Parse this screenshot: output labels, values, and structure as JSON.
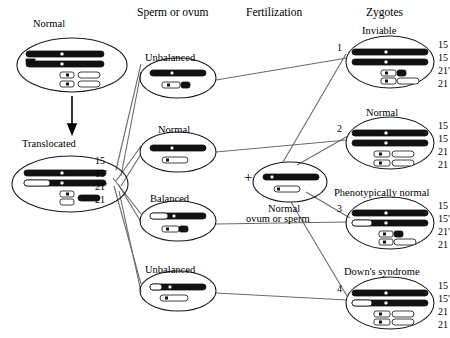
{
  "diagram": {
    "headers": [
      {
        "name": "sperm-or-ovum",
        "text": "Sperm or ovum",
        "x": 137,
        "y": 6
      },
      {
        "name": "fertilization",
        "text": "Fertilization",
        "x": 246,
        "y": 6
      },
      {
        "name": "zygotes",
        "text": "Zygotes",
        "x": 366,
        "y": 6
      }
    ],
    "parents": [
      {
        "name": "normal-parent",
        "caption": "Normal",
        "cx": 72,
        "cy": 65,
        "rx": 55,
        "ry": 27,
        "cap_x": 33,
        "cap_y": 18
      },
      {
        "name": "translocated-parent",
        "caption": "Translocated",
        "cx": 70,
        "cy": 184,
        "rx": 58,
        "ry": 28,
        "cap_x": 22,
        "cap_y": 138
      }
    ],
    "parent_arrow": {
      "name": "meiosis-arrow",
      "x": 72,
      "y1": 95,
      "y2": 131
    },
    "karyotype_labels": {
      "name": "parent-karyotype-labels",
      "x": 95,
      "y": 155,
      "items": [
        "15",
        "15'",
        "21'",
        "21"
      ]
    },
    "gametes": [
      {
        "name": "gamete-unbalanced-1",
        "caption": "Unbalanced",
        "cx": 178,
        "cy": 78,
        "rx": 38,
        "ry": 20,
        "cap_x": 145,
        "cap_y": 52
      },
      {
        "name": "gamete-normal",
        "caption": "Normal",
        "cx": 178,
        "cy": 152,
        "rx": 38,
        "ry": 20,
        "cap_x": 158,
        "cap_y": 124
      },
      {
        "name": "gamete-balanced",
        "caption": "Balanced",
        "cx": 178,
        "cy": 221,
        "rx": 38,
        "ry": 20,
        "cap_x": 150,
        "cap_y": 193
      },
      {
        "name": "gamete-unbalanced-2",
        "caption": "Unbalanced",
        "cx": 178,
        "cy": 291,
        "rx": 38,
        "ry": 20,
        "cap_x": 145,
        "cap_y": 264
      }
    ],
    "fertilization": {
      "plus_sign": "+",
      "plus_x": 244,
      "plus_y": 177,
      "partner": {
        "name": "normal-ovum-or-sperm",
        "cx": 290,
        "cy": 182,
        "rx": 37,
        "ry": 20,
        "caption_line1": "Normal",
        "caption_line2": "ovum or sperm",
        "cap_x": 246,
        "cap_y": 203
      }
    },
    "zygotes": [
      {
        "name": "zygote-1",
        "number": "1",
        "caption": "Inviable",
        "cx": 390,
        "cy": 62,
        "rx": 44,
        "ry": 26,
        "cap_x": 362,
        "cap_y": 25,
        "num_x": 337,
        "num_y": 43,
        "labels": [
          "15",
          "15",
          "21'",
          "21"
        ],
        "lab_x": 438,
        "lab_y": 39
      },
      {
        "name": "zygote-2",
        "number": "2",
        "caption": "Normal",
        "cx": 390,
        "cy": 143,
        "rx": 44,
        "ry": 26,
        "cap_x": 366,
        "cap_y": 107,
        "num_x": 337,
        "num_y": 124,
        "labels": [
          "15",
          "15",
          "21",
          "21"
        ],
        "lab_x": 438,
        "lab_y": 120
      },
      {
        "name": "zygote-3",
        "number": "3",
        "caption": "Phenotypically normal",
        "cx": 390,
        "cy": 223,
        "rx": 44,
        "ry": 26,
        "cap_x": 334,
        "cap_y": 187,
        "num_x": 337,
        "num_y": 204,
        "labels": [
          "15",
          "15'",
          "21'",
          "21"
        ],
        "lab_x": 438,
        "lab_y": 200
      },
      {
        "name": "zygote-4",
        "number": "4",
        "caption": "Down's syndrome",
        "cx": 390,
        "cy": 303,
        "rx": 44,
        "ry": 26,
        "cap_x": 344,
        "cap_y": 266,
        "num_x": 337,
        "num_y": 284,
        "labels": [
          "15",
          "15'",
          "21",
          "21"
        ],
        "lab_x": 438,
        "lab_y": 280
      }
    ],
    "colors": {
      "ink": "#000000",
      "line": "#6b6b6b",
      "chromosome_dark": "#111111",
      "chromosome_light": "#ffffff",
      "outline": "#1a1a1a"
    }
  }
}
